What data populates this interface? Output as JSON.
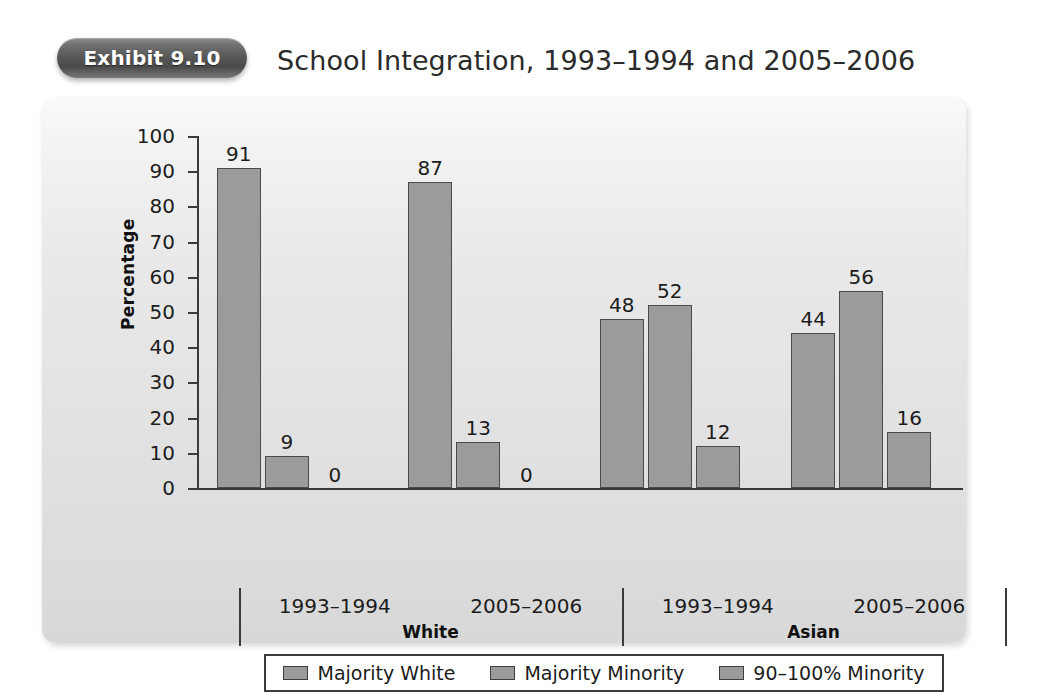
{
  "header": {
    "badge_label": "Exhibit 9.10",
    "title": "School Integration, 1993–1994 and 2005–2006"
  },
  "chart_data": {
    "type": "bar",
    "title": "School Integration, 1993–1994 and 2005–2006",
    "xlabel": "",
    "ylabel": "Percentage",
    "ylim": [
      0,
      100
    ],
    "ytick_step": 10,
    "yticks": [
      100,
      90,
      80,
      70,
      60,
      50,
      40,
      30,
      20,
      10,
      0
    ],
    "grid": false,
    "legend_position": "bottom",
    "categories": [
      "1993–1994",
      "2005–2006",
      "1993–1994",
      "2005–2006"
    ],
    "groups": [
      {
        "name": "White",
        "categories": [
          "1993–1994",
          "2005–2006"
        ]
      },
      {
        "name": "Asian",
        "categories": [
          "1993–1994",
          "2005–2006"
        ]
      }
    ],
    "series": [
      {
        "name": "Majority White",
        "values": [
          91,
          87,
          48,
          44
        ]
      },
      {
        "name": "Majority Minority",
        "values": [
          9,
          13,
          52,
          56
        ]
      },
      {
        "name": "90–100% Minority",
        "values": [
          0,
          0,
          12,
          16
        ]
      }
    ],
    "colors": {
      "bar_fill": "#9b9b9b",
      "bar_stroke": "#4b4b4b",
      "axis": "#3a3a3a",
      "panel_background": "#e3e3e3",
      "badge_background": "#565656",
      "text": "#1c1c1c"
    }
  },
  "axis": {
    "y_title": "Percentage"
  },
  "legend": {
    "items": [
      {
        "label": "Majority White"
      },
      {
        "label": "Majority Minority"
      },
      {
        "label": "90–100% Minority"
      }
    ]
  }
}
